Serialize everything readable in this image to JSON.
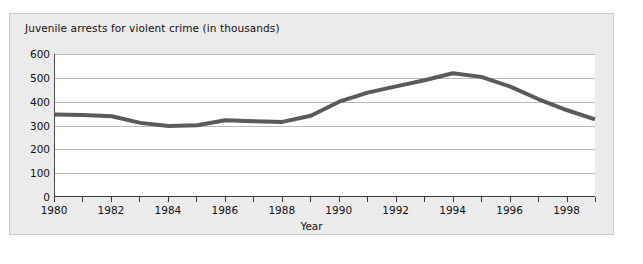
{
  "figure": {
    "title": "Juvenile arrests for violent crime (in thousands)",
    "background_color": "#ebebeb",
    "plot_background_color": "#ffffff",
    "border_color": "#c9c9c9"
  },
  "chart_data": {
    "type": "line",
    "title": "Juvenile arrests for violent crime (in thousands)",
    "xlabel": "Year",
    "ylabel": "",
    "xlim": [
      1980,
      1999
    ],
    "ylim": [
      0,
      600
    ],
    "ytick_step": 100,
    "xtick_step": 1,
    "xtick_label_step": 2,
    "grid": "horizontal",
    "legend": "none",
    "line_color": "#5a5a5a",
    "line_width": 4,
    "ytick_labels": [
      "0",
      "100",
      "200",
      "300",
      "400",
      "500",
      "600"
    ],
    "ytick_values": [
      0,
      100,
      200,
      300,
      400,
      500,
      600
    ],
    "xtick_values": [
      1980,
      1981,
      1982,
      1983,
      1984,
      1985,
      1986,
      1987,
      1988,
      1989,
      1990,
      1991,
      1992,
      1993,
      1994,
      1995,
      1996,
      1997,
      1998,
      1999
    ],
    "xtick_labels": [
      "1980",
      "",
      "1982",
      "",
      "1984",
      "",
      "1986",
      "",
      "1988",
      "",
      "1990",
      "",
      "1992",
      "",
      "1994",
      "",
      "1996",
      "",
      "1998",
      ""
    ],
    "x": [
      1980,
      1981,
      1982,
      1983,
      1984,
      1985,
      1986,
      1987,
      1988,
      1989,
      1990,
      1991,
      1992,
      1993,
      1994,
      1995,
      1996,
      1997,
      1998,
      1999
    ],
    "values": [
      346,
      344,
      339,
      311,
      298,
      301,
      322,
      318,
      315,
      341,
      400,
      438,
      464,
      490,
      519,
      504,
      464,
      411,
      365,
      326
    ],
    "series": [
      {
        "name": "Juvenile arrests for violent crime",
        "values": [
          346,
          344,
          339,
          311,
          298,
          301,
          322,
          318,
          315,
          341,
          400,
          438,
          464,
          490,
          519,
          504,
          464,
          411,
          365,
          326
        ]
      }
    ]
  }
}
